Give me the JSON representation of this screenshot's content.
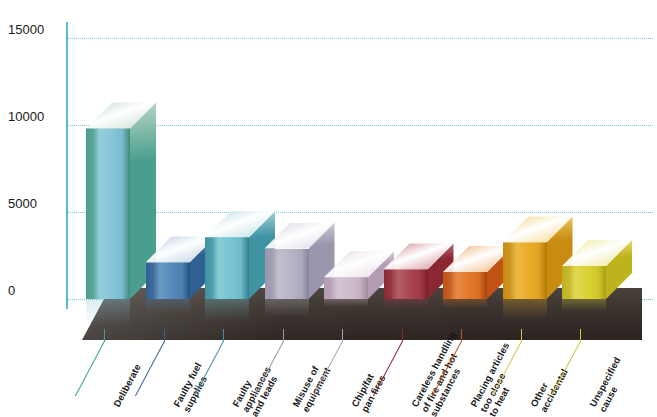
{
  "chart_data": {
    "type": "bar",
    "title": "",
    "xlabel": "",
    "ylabel": "",
    "ylim": [
      0,
      15000
    ],
    "grid": true,
    "legend": "none",
    "yticks": [
      "0",
      "5000",
      "10000",
      "15000"
    ],
    "ytick_values": [
      0,
      5000,
      10000,
      15000
    ],
    "categories": [
      "Deliberate",
      "Faulty fuel supplies",
      "Faulty appliances and leads",
      "Misuse of equipment",
      "Chip/fat pan fires",
      "Careless handling of fire and hot substances",
      "Placing articles too close to heat",
      "Other accidental",
      "Unspecified cause"
    ],
    "values": [
      9800,
      2100,
      3550,
      2900,
      1250,
      1700,
      1550,
      3250,
      1900
    ],
    "colors": [
      "#7ec2d6",
      "#4b83b5",
      "#6fc0cf",
      "#b4b0c3",
      "#cbb8c9",
      "#a63a46",
      "#e0701f",
      "#e8a81c",
      "#d9cf2a"
    ],
    "side_colors": [
      "#4a9e8e",
      "#2f5f93",
      "#3f93a3",
      "#9a96ad",
      "#b49cb4",
      "#8a2733",
      "#c05214",
      "#c78c10",
      "#bdb31c"
    ],
    "top_colors": [
      "#b9d6c4",
      "#a7c0d8",
      "#a9d6dc",
      "#cfccd9",
      "#e0d2de",
      "#c3737c",
      "#ef9f5c",
      "#f2cc66",
      "#e9e27a"
    ]
  },
  "axis": {
    "y_labels": [
      {
        "text": "15000",
        "value": 15000
      },
      {
        "text": "10000",
        "value": 10000
      },
      {
        "text": "5000",
        "value": 5000
      },
      {
        "text": "0",
        "value": 0
      }
    ]
  },
  "series": {
    "bars": [
      {
        "label": "Deliberate",
        "value": 9800,
        "front": "#7ec2d6",
        "side": "#4a9e8e",
        "top": "#b9d6c4",
        "leader": "#3e9f8d"
      },
      {
        "label": "Faulty fuel\nsupplies",
        "value": 2100,
        "front": "#4b83b5",
        "side": "#2f5f93",
        "top": "#a7c0d8",
        "leader": "#39639c"
      },
      {
        "label": "Faulty\nappliances\nand leads",
        "value": 3550,
        "front": "#6fc0cf",
        "side": "#3f93a3",
        "top": "#a9d6dc",
        "leader": "#3f93a3"
      },
      {
        "label": "Misuse of\nequipment",
        "value": 2900,
        "front": "#b4b0c3",
        "side": "#9a96ad",
        "top": "#cfccd9",
        "leader": "#9a96ad"
      },
      {
        "label": "Chip/fat\npan fires",
        "value": 1250,
        "front": "#cbb8c9",
        "side": "#b49cb4",
        "top": "#e0d2de",
        "leader": "#b49cb4"
      },
      {
        "label": "Careless handling\nof fire and hot\nsubstances",
        "value": 1700,
        "front": "#a63a46",
        "side": "#8a2733",
        "top": "#c3737c",
        "leader": "#8a2733"
      },
      {
        "label": "Placing articles\ntoo close\nto heat",
        "value": 1550,
        "front": "#e0701f",
        "side": "#c05214",
        "top": "#ef9f5c",
        "leader": "#b85818"
      },
      {
        "label": "Other\naccidental",
        "value": 3250,
        "front": "#e8a81c",
        "side": "#c78c10",
        "top": "#f2cc66",
        "leader": "#d8c24a"
      },
      {
        "label": "Unspecified\ncause",
        "value": 1900,
        "front": "#d9cf2a",
        "side": "#bdb31c",
        "top": "#e9e27a",
        "leader": "#d2c93a"
      }
    ]
  }
}
